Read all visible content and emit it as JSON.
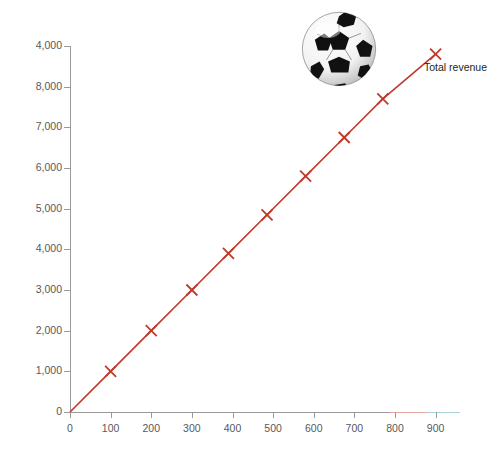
{
  "chart_data": {
    "type": "line",
    "title": "",
    "subtitle": "",
    "xlabel": "",
    "ylabel": "Total revenue (£)",
    "xlim": [
      0,
      960
    ],
    "ylim": [
      0,
      9000
    ],
    "grid": false,
    "legend_position": "right-of-line-end",
    "series": [
      {
        "name": "Total revenue",
        "color": "#c0392b",
        "marker": "x",
        "x": [
          0,
          100,
          200,
          300,
          390,
          485,
          580,
          675,
          770,
          900
        ],
        "values": [
          0,
          1000,
          2000,
          3000,
          3900,
          4850,
          5800,
          6750,
          7700,
          8800
        ]
      }
    ],
    "x_tick_labels": [
      "0",
      "100",
      "200",
      "300",
      "400",
      "500",
      "600",
      "700",
      "800",
      "900"
    ],
    "x_tick_values": [
      0,
      100,
      200,
      300,
      400,
      500,
      600,
      700,
      800,
      900
    ],
    "y_tick_labels": [
      "4,000",
      "8,000",
      "7,000",
      "6,000",
      "5,000",
      "4,000",
      "3,000",
      "2,000",
      "1,000",
      "0"
    ],
    "y_tick_values": [
      9000,
      8000,
      7000,
      6000,
      5000,
      4000,
      3000,
      2000,
      1000,
      0
    ],
    "annotations": [
      {
        "name": "soccer-ball-image",
        "description": "soccer ball"
      }
    ]
  },
  "legend": {
    "label": "Total revenue"
  },
  "axes": {
    "y_title": "Total revenue (£)"
  },
  "colors": {
    "series": "#c0392b",
    "axis": "#9a9a9a",
    "tick_text": "#58595b",
    "title_text": "#1a1a1a",
    "background": "#ffffff"
  }
}
